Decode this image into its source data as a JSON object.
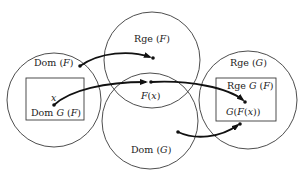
{
  "diagram": {
    "type": "function-composition-venn",
    "colors": {
      "stroke": "#3a3a3a",
      "arrow": "#111111",
      "background": "#ffffff"
    },
    "sets": [
      {
        "id": "dom-f",
        "label_main": "Dom ",
        "label_open": "(",
        "label_var": "F",
        "label_close": ")"
      },
      {
        "id": "rge-f",
        "label_main": "Rge ",
        "label_open": "(",
        "label_var": "F",
        "label_close": ")"
      },
      {
        "id": "dom-g",
        "label_main": "Dom ",
        "label_open": "(",
        "label_var": "G",
        "label_close": ")"
      },
      {
        "id": "rge-g",
        "label_main": "Rge ",
        "label_open": "(",
        "label_var": "G",
        "label_close": ")"
      }
    ],
    "subsets": [
      {
        "id": "dom-gf",
        "label_main": "Dom ",
        "label_var": "G",
        "label_open": " (",
        "label_var2": "F",
        "label_close": ")"
      },
      {
        "id": "rge-gf",
        "label_main": "Rge ",
        "label_var": "G",
        "label_open": " (",
        "label_var2": "F",
        "label_close": ")"
      }
    ],
    "points": {
      "x": {
        "var": "x"
      },
      "fx": {
        "var": "F",
        "open": "(",
        "arg": "x",
        "close": ")"
      },
      "gfx": {
        "var1": "G",
        "open1": "(",
        "var2": "F",
        "open2": "(",
        "arg": "x",
        "close": "))"
      }
    }
  }
}
